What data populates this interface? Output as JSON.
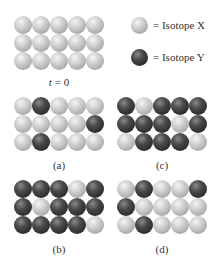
{
  "legend": [
    {
      "key": "X",
      "label": "= Isotope X",
      "color": "#c8c8c8"
    },
    {
      "key": "Y",
      "label": "= Isotope Y",
      "color": "#333333"
    }
  ],
  "panels": [
    {
      "id": "t0",
      "label_italic": "t",
      "label_rest": " = 0",
      "rows": [
        [
          "X",
          "X",
          "X",
          "X",
          "X"
        ],
        [
          "X",
          "X",
          "X",
          "X",
          "X"
        ],
        [
          "X",
          "X",
          "X",
          "X",
          "X"
        ]
      ]
    },
    {
      "id": "a",
      "label": "(a)",
      "rows": [
        [
          "X",
          "Y",
          "X",
          "X",
          "X"
        ],
        [
          "X",
          "X",
          "X",
          "X",
          "Y"
        ],
        [
          "X",
          "Y",
          "X",
          "X",
          "X"
        ]
      ]
    },
    {
      "id": "c",
      "label": "(c)",
      "rows": [
        [
          "Y",
          "X",
          "Y",
          "Y",
          "Y"
        ],
        [
          "Y",
          "Y",
          "Y",
          "X",
          "Y"
        ],
        [
          "X",
          "Y",
          "Y",
          "Y",
          "X"
        ]
      ]
    },
    {
      "id": "b",
      "label": "(b)",
      "rows": [
        [
          "Y",
          "Y",
          "Y",
          "X",
          "Y"
        ],
        [
          "Y",
          "X",
          "Y",
          "Y",
          "Y"
        ],
        [
          "Y",
          "Y",
          "Y",
          "Y",
          "X"
        ]
      ]
    },
    {
      "id": "d",
      "label": "(d)",
      "rows": [
        [
          "X",
          "Y",
          "X",
          "X",
          "Y"
        ],
        [
          "Y",
          "X",
          "X",
          "X",
          "X"
        ],
        [
          "X",
          "Y",
          "X",
          "X",
          "X"
        ]
      ]
    }
  ]
}
